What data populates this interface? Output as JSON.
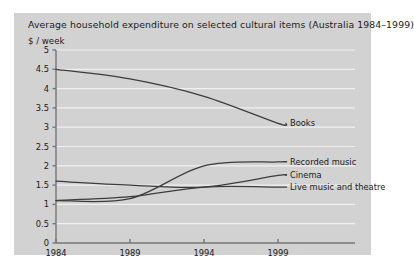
{
  "figure": {
    "panel_bg": "#d2d2d2",
    "page_bg": "#ffffff",
    "grid_color": "#f0f0f0",
    "axis_color": "#767676",
    "line_color": "#3c3c3c",
    "text_color": "#1a1a1a"
  },
  "chart_data": {
    "type": "line",
    "title": "Average household expenditure on selected cultural items (Australia 1984–1999)",
    "ylabel": "$ / week",
    "xlabel": "",
    "x": [
      1984,
      1989,
      1994,
      1999
    ],
    "xticks": [
      "1984",
      "1989",
      "1994",
      "1999"
    ],
    "yticks": [
      "0",
      "0.5",
      "1",
      "1.5",
      "2",
      "2.5",
      "3",
      "3.5",
      "4",
      "4.5",
      "5"
    ],
    "ytick_values": [
      0,
      0.5,
      1,
      1.5,
      2,
      2.5,
      3,
      3.5,
      4,
      4.5,
      5
    ],
    "ylim": [
      0,
      5
    ],
    "xlim": [
      1984,
      1999
    ],
    "grid": true,
    "legend_position": "right-inline",
    "series": [
      {
        "name": "Books",
        "values": [
          4.5,
          4.25,
          3.8,
          3.1
        ],
        "label": "Books",
        "label_y": 3.1
      },
      {
        "name": "Recorded music",
        "values": [
          1.1,
          1.15,
          2.0,
          2.1
        ],
        "label": "Recorded music",
        "label_y": 2.1
      },
      {
        "name": "Cinema",
        "values": [
          1.6,
          1.5,
          1.45,
          1.75
        ],
        "label": "Cinema",
        "label_y": 1.75
      },
      {
        "name": "Live music and theatre",
        "values": [
          1.1,
          1.2,
          1.45,
          1.45
        ],
        "label": "Live music and theatre",
        "label_y": 1.45
      }
    ]
  }
}
